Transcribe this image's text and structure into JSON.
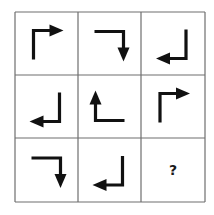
{
  "puzzle": {
    "title": "Arrow rotation matrix puzzle",
    "rows": 3,
    "cols": 3,
    "colors": {
      "line": "#6e6e6e",
      "arrow": "#111111",
      "background": "#ffffff"
    },
    "cells": [
      {
        "row": 0,
        "col": 0,
        "type": "arrow",
        "shape": "up-then-right",
        "direction": "right"
      },
      {
        "row": 0,
        "col": 1,
        "type": "arrow",
        "shape": "right-then-down",
        "direction": "down"
      },
      {
        "row": 0,
        "col": 2,
        "type": "arrow",
        "shape": "down-then-left",
        "direction": "left"
      },
      {
        "row": 1,
        "col": 0,
        "type": "arrow",
        "shape": "down-then-left",
        "direction": "left"
      },
      {
        "row": 1,
        "col": 1,
        "type": "arrow",
        "shape": "left-then-up",
        "direction": "up"
      },
      {
        "row": 1,
        "col": 2,
        "type": "arrow",
        "shape": "up-then-right",
        "direction": "right"
      },
      {
        "row": 2,
        "col": 0,
        "type": "arrow",
        "shape": "right-then-down",
        "direction": "down"
      },
      {
        "row": 2,
        "col": 1,
        "type": "arrow",
        "shape": "down-then-left",
        "direction": "left"
      },
      {
        "row": 2,
        "col": 2,
        "type": "question",
        "label": "?"
      }
    ]
  }
}
